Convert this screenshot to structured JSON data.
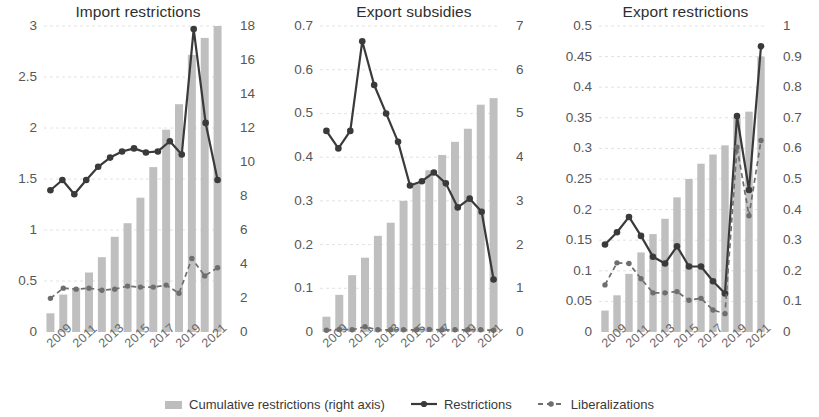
{
  "figure": {
    "colors": {
      "bar": "#bfbfbf",
      "restrictions_line": "#3a3a3a",
      "liberalizations_line": "#6e6e6e",
      "grid": "#e2e2e2",
      "text": "#3c3c3c"
    },
    "legend": [
      {
        "key": "cumulative",
        "label": "Cumulative restrictions (right axis)",
        "marker": "bar-swatch"
      },
      {
        "key": "restrictions",
        "label": "Restrictions",
        "marker": "solid-line-dot"
      },
      {
        "key": "liberalizations",
        "label": "Liberalizations",
        "marker": "dashed-line-dot"
      }
    ]
  },
  "chart_data": [
    {
      "type": "bar",
      "title": "Import restrictions",
      "xlabel": "",
      "ylabel": "",
      "grid": true,
      "legend_position": "bottom",
      "x": [
        2009,
        2010,
        2011,
        2012,
        2013,
        2014,
        2015,
        2016,
        2017,
        2018,
        2019,
        2020,
        2021,
        2022
      ],
      "categories": [
        "2009",
        "2010",
        "2011",
        "2012",
        "2013",
        "2014",
        "2015",
        "2016",
        "2017",
        "2018",
        "2019",
        "2020",
        "2021",
        "2022"
      ],
      "xtick_labels": [
        "2009",
        "2011",
        "2013",
        "2015",
        "2017",
        "2019",
        "2021"
      ],
      "xtick_values": [
        2009,
        2011,
        2013,
        2015,
        2017,
        2019,
        2021
      ],
      "ylim": [
        0,
        3
      ],
      "ytick_labels": [
        "0",
        "0.5",
        "1",
        "1.5",
        "2",
        "2.5",
        "3"
      ],
      "ytick_values": [
        0,
        0.5,
        1,
        1.5,
        2,
        2.5,
        3
      ],
      "ylim_right": [
        0,
        18
      ],
      "ytick_labels_right": [
        "0",
        "2",
        "4",
        "6",
        "8",
        "10",
        "12",
        "14",
        "16",
        "18"
      ],
      "ytick_values_right": [
        0,
        2,
        4,
        6,
        8,
        10,
        12,
        14,
        16,
        18
      ],
      "series": [
        {
          "name": "Cumulative restrictions (right axis)",
          "type": "bar",
          "axis": "right",
          "values": [
            1.1,
            2.2,
            2.6,
            3.5,
            4.4,
            5.6,
            6.4,
            7.9,
            9.7,
            11.9,
            13.4,
            16.3,
            17.3,
            18.0
          ]
        },
        {
          "name": "Restrictions",
          "type": "line",
          "axis": "left",
          "values": [
            1.39,
            1.49,
            1.35,
            1.49,
            1.62,
            1.71,
            1.77,
            1.8,
            1.76,
            1.77,
            1.87,
            1.74,
            2.97,
            2.05,
            1.49
          ]
        },
        {
          "name": "Liberalizations",
          "type": "line",
          "axis": "left",
          "values": [
            0.33,
            0.43,
            0.42,
            0.43,
            0.41,
            0.42,
            0.45,
            0.44,
            0.44,
            0.46,
            0.38,
            0.72,
            0.55,
            0.63
          ]
        }
      ]
    },
    {
      "type": "bar",
      "title": "Export subsidies",
      "xlabel": "",
      "ylabel": "",
      "grid": true,
      "legend_position": "bottom",
      "x": [
        2009,
        2010,
        2011,
        2012,
        2013,
        2014,
        2015,
        2016,
        2017,
        2018,
        2019,
        2020,
        2021,
        2022
      ],
      "categories": [
        "2009",
        "2010",
        "2011",
        "2012",
        "2013",
        "2014",
        "2015",
        "2016",
        "2017",
        "2018",
        "2019",
        "2020",
        "2021",
        "2022"
      ],
      "xtick_labels": [
        "2009",
        "2011",
        "2013",
        "2015",
        "2017",
        "2019",
        "2021"
      ],
      "xtick_values": [
        2009,
        2011,
        2013,
        2015,
        2017,
        2019,
        2021
      ],
      "ylim": [
        0,
        0.7
      ],
      "ytick_labels": [
        "0",
        "0.1",
        "0.2",
        "0.3",
        "0.4",
        "0.5",
        "0.6",
        "0.7"
      ],
      "ytick_values": [
        0,
        0.1,
        0.2,
        0.3,
        0.4,
        0.5,
        0.6,
        0.7
      ],
      "ylim_right": [
        0,
        7
      ],
      "ytick_labels_right": [
        "0",
        "1",
        "2",
        "3",
        "4",
        "5",
        "6",
        "7"
      ],
      "ytick_values_right": [
        0,
        1,
        2,
        3,
        4,
        5,
        6,
        7
      ],
      "series": [
        {
          "name": "Cumulative restrictions (right axis)",
          "type": "bar",
          "axis": "right",
          "values": [
            0.35,
            0.85,
            1.3,
            1.7,
            2.2,
            2.5,
            3.0,
            3.4,
            3.7,
            4.05,
            4.35,
            4.65,
            5.2,
            5.35
          ]
        },
        {
          "name": "Restrictions",
          "type": "line",
          "axis": "left",
          "values": [
            0.46,
            0.42,
            0.46,
            0.665,
            0.565,
            0.5,
            0.435,
            0.335,
            0.345,
            0.365,
            0.34,
            0.285,
            0.305,
            0.275,
            0.12
          ]
        },
        {
          "name": "Liberalizations",
          "type": "line",
          "axis": "left",
          "values": [
            0.004,
            0.006,
            0.005,
            0.012,
            0.005,
            0.005,
            0.005,
            0.005,
            0.006,
            0.005,
            0.005,
            0.005,
            0.005,
            0.004
          ]
        }
      ]
    },
    {
      "type": "bar",
      "title": "Export restrictions",
      "xlabel": "",
      "ylabel": "",
      "grid": true,
      "legend_position": "bottom",
      "x": [
        2009,
        2010,
        2011,
        2012,
        2013,
        2014,
        2015,
        2016,
        2017,
        2018,
        2019,
        2020,
        2021,
        2022
      ],
      "categories": [
        "2009",
        "2010",
        "2011",
        "2012",
        "2013",
        "2014",
        "2015",
        "2016",
        "2017",
        "2018",
        "2019",
        "2020",
        "2021",
        "2022"
      ],
      "xtick_labels": [
        "2009",
        "2011",
        "2013",
        "2015",
        "2017",
        "2019",
        "2021"
      ],
      "xtick_values": [
        2009,
        2011,
        2013,
        2015,
        2017,
        2019,
        2021
      ],
      "ylim": [
        0,
        0.5
      ],
      "ytick_labels": [
        "0",
        "0.05",
        "0.1",
        "0.15",
        "0.2",
        "0.25",
        "0.3",
        "0.35",
        "0.4",
        "0.45",
        "0.5"
      ],
      "ytick_values": [
        0,
        0.05,
        0.1,
        0.15,
        0.2,
        0.25,
        0.3,
        0.35,
        0.4,
        0.45,
        0.5
      ],
      "ylim_right": [
        0,
        1
      ],
      "ytick_labels_right": [
        "0",
        "0.1",
        "0.2",
        "0.3",
        "0.4",
        "0.5",
        "0.6",
        "0.7",
        "0.8",
        "0.9",
        "1"
      ],
      "ytick_values_right": [
        0,
        0.1,
        0.2,
        0.3,
        0.4,
        0.5,
        0.6,
        0.7,
        0.8,
        0.9,
        1
      ],
      "series": [
        {
          "name": "Cumulative restrictions (right axis)",
          "type": "bar",
          "axis": "right",
          "values": [
            0.07,
            0.12,
            0.19,
            0.26,
            0.32,
            0.37,
            0.44,
            0.5,
            0.55,
            0.58,
            0.61,
            0.7,
            0.72,
            0.9
          ]
        },
        {
          "name": "Restrictions",
          "type": "line",
          "axis": "left",
          "values": [
            0.143,
            0.163,
            0.188,
            0.157,
            0.123,
            0.112,
            0.14,
            0.107,
            0.107,
            0.083,
            0.063,
            0.353,
            0.232,
            0.467
          ]
        },
        {
          "name": "Liberalizations",
          "type": "line",
          "axis": "left",
          "values": [
            0.077,
            0.113,
            0.112,
            0.087,
            0.064,
            0.064,
            0.066,
            0.052,
            0.055,
            0.036,
            0.03,
            0.302,
            0.19,
            0.313
          ]
        }
      ]
    }
  ]
}
